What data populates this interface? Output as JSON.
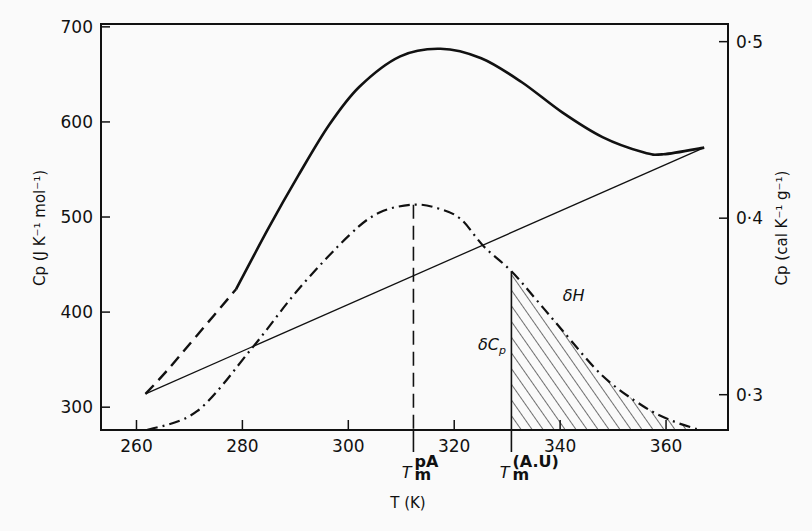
{
  "chart_data": {
    "type": "line",
    "title": "",
    "xlabel": "T (K)",
    "ylabel": "Cp (J K⁻¹ mol⁻¹)",
    "y2label": "Cp (cal K⁻¹ g⁻¹)",
    "xlim": [
      253.3,
      371.7
    ],
    "ylim": [
      276,
      703
    ],
    "y2lim": [
      0.28,
      0.51
    ],
    "x_ticks": [
      260,
      280,
      300,
      320,
      340,
      360
    ],
    "x_tick_labels": [
      "260",
      "280",
      "300",
      "320",
      "340",
      "360"
    ],
    "y_ticks": [
      300,
      400,
      500,
      600,
      700
    ],
    "y_tick_labels": [
      "300",
      "400",
      "500",
      "600",
      "700"
    ],
    "y2_ticks": [
      0.3,
      0.4,
      0.5
    ],
    "y2_tick_labels": [
      "0·3",
      "0·4",
      "0·5"
    ],
    "grid": false,
    "legend": "none",
    "series": [
      {
        "name": "total heat capacity",
        "style": "dashed-then-solid",
        "solid_from_x": 278.8,
        "x": [
          261.7,
          265.7,
          271.5,
          278.8,
          284.9,
          290.6,
          296.4,
          302.1,
          309.8,
          317.4,
          325.1,
          332.7,
          340.4,
          348.0,
          355.7,
          359.5,
          367.2
        ],
        "y": [
          314,
          338,
          376,
          424,
          488,
          544,
          597,
          637,
          669,
          677,
          667,
          642,
          610,
          584,
          568,
          566,
          573
        ]
      },
      {
        "name": "baseline",
        "style": "thin-solid",
        "x": [
          261.7,
          367.2
        ],
        "y": [
          314,
          573
        ]
      },
      {
        "name": "excess heat capacity",
        "style": "dash-dot",
        "x": [
          262.0,
          271.5,
          281.8,
          290.6,
          300.2,
          306.0,
          312.3,
          317.0,
          321.2,
          325.6,
          330.8,
          335.5,
          340.4,
          348.0,
          355.7,
          361.0,
          365.8
        ],
        "y": [
          276,
          296,
          362,
          424,
          481,
          505,
          513,
          509,
          498,
          469,
          443,
          413,
          381,
          333,
          301,
          286,
          277
        ]
      }
    ],
    "annotations": [
      {
        "text": "δH",
        "x": 340.5,
        "y": 412
      },
      {
        "text": "δC",
        "sub": "p",
        "x": 324.5,
        "y": 360
      },
      {
        "label": "T",
        "sup": "pA",
        "sub": "m",
        "x": 312.3,
        "style": "dashed-vertical"
      },
      {
        "label": "T",
        "sup": "(A.U)",
        "sub": "m",
        "x": 330.8,
        "style": "solid-vertical"
      }
    ],
    "shaded_region": {
      "from_x": 330.8,
      "to_x": 365.8,
      "under_series": "excess heat capacity",
      "pattern": "diagonal-hatch"
    }
  }
}
